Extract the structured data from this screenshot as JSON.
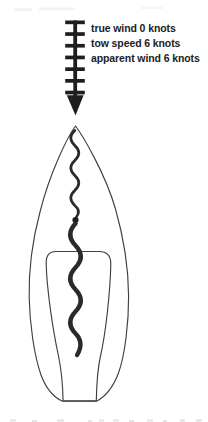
{
  "figure": {
    "wind_labels": [
      "true wind 0 knots",
      "tow speed 6 knots",
      "apparent wind 6 knots"
    ],
    "icons": {
      "wind_arrow": "feathered-down-arrow",
      "wind_arrow_feather_count": 7,
      "wind_arrow_direction": "down"
    },
    "colors": {
      "ink": "#201d1e",
      "line": "#404040",
      "wavy": "#2a2a2a",
      "paper": "#ffffff"
    }
  }
}
